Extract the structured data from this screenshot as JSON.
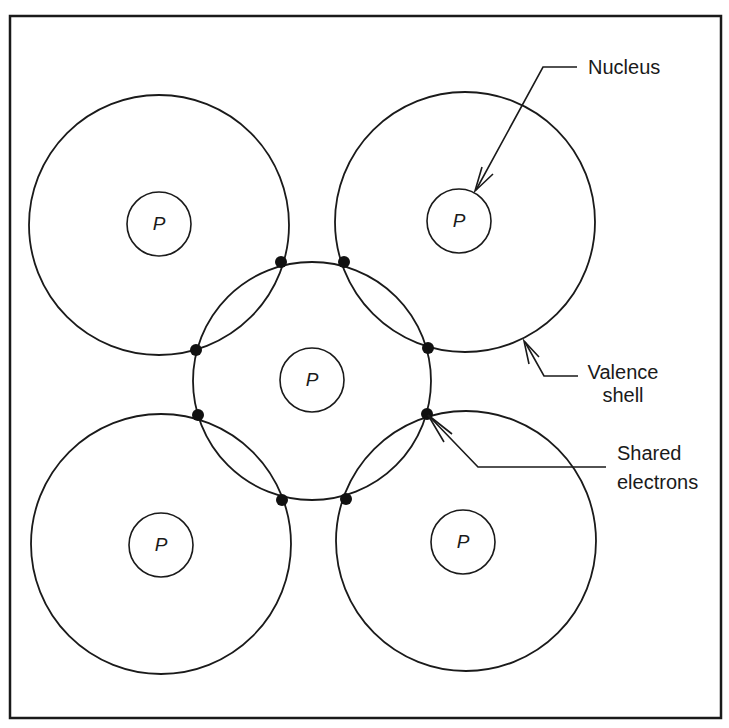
{
  "figure": {
    "frame": {
      "x": 10,
      "y": 16,
      "width": 711,
      "height": 702,
      "stroke": "#1a1a1a"
    },
    "colors": {
      "stroke": "#1a1a1a",
      "background": "#ffffff",
      "electron": "#111111"
    }
  },
  "atoms": [
    {
      "id": "top-left",
      "shell": {
        "cx": 159,
        "cy": 225,
        "r": 130
      },
      "nucleus": {
        "cx": 159,
        "cy": 224,
        "r": 32
      },
      "label": "P"
    },
    {
      "id": "top-right",
      "shell": {
        "cx": 465,
        "cy": 222,
        "r": 130
      },
      "nucleus": {
        "cx": 459,
        "cy": 221,
        "r": 32
      },
      "label": "P"
    },
    {
      "id": "center",
      "shell": {
        "cx": 312,
        "cy": 381,
        "r": 119
      },
      "nucleus": {
        "cx": 312,
        "cy": 380,
        "r": 32
      },
      "label": "P"
    },
    {
      "id": "bottom-left",
      "shell": {
        "cx": 161,
        "cy": 544,
        "r": 130
      },
      "nucleus": {
        "cx": 161,
        "cy": 545,
        "r": 32
      },
      "label": "P"
    },
    {
      "id": "bottom-right",
      "shell": {
        "cx": 466,
        "cy": 541,
        "r": 130
      },
      "nucleus": {
        "cx": 463,
        "cy": 542,
        "r": 32
      },
      "label": "P"
    }
  ],
  "shared_electrons": [
    {
      "cx": 281,
      "cy": 262
    },
    {
      "cx": 344,
      "cy": 262
    },
    {
      "cx": 196,
      "cy": 350
    },
    {
      "cx": 428,
      "cy": 348
    },
    {
      "cx": 198,
      "cy": 415
    },
    {
      "cx": 427,
      "cy": 414
    },
    {
      "cx": 282,
      "cy": 500
    },
    {
      "cx": 346,
      "cy": 499
    }
  ],
  "callouts": {
    "nucleus": {
      "text": "Nucleus",
      "line": "M577,67 L543,67 L476,190",
      "barbs": "M482,167 L475,191 L493,174"
    },
    "valence_shell": {
      "line1": "Valence",
      "line2": "shell",
      "line": "M578,376 L544,376 L525,342",
      "barbs": "M529,364 L524,341 L539,357"
    },
    "shared_electrons": {
      "line1": "Shared",
      "line2": "electrons",
      "line": "M606,467 L478,467 L428,415",
      "barbs": "M452,434 L428,415 L444,442"
    }
  }
}
